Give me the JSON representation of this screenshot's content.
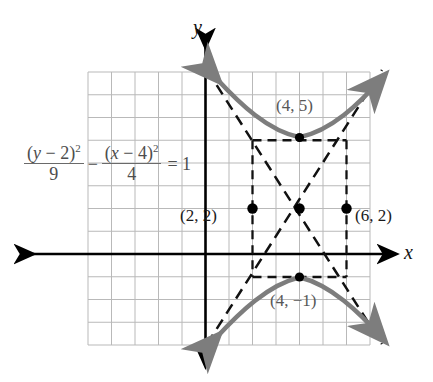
{
  "figure": {
    "colors": {
      "grid": "#b9b9b9",
      "axis": "#000000",
      "curve": "#7d7d7d",
      "asymptote": "#111111",
      "point": "#000000",
      "equation_text": "#4d4d4d"
    }
  },
  "equation": {
    "numerator_1": "(y − 2)",
    "numerator_1_exp": "2",
    "denominator_1": "9",
    "operator": "−",
    "numerator_2": "(x − 4)",
    "numerator_2_exp": "2",
    "denominator_2": "4",
    "equals": "= 1",
    "plain": "(y − 2)²/9 − (x − 4)²/4 = 1"
  },
  "axes": {
    "x_label": "x",
    "y_label": "y"
  },
  "labels": {
    "vertex_top": "(4, 5)",
    "vertex_bottom": "(4, −1)",
    "point_left": "(2, 2)",
    "point_right": "(6, 2)"
  },
  "chart_data": {
    "type": "line",
    "xlabel": "x",
    "ylabel": "y",
    "grid": true,
    "legend": "none",
    "xlim": [
      -2,
      10
    ],
    "ylim": [
      -6,
      6
    ],
    "grid_step": 1,
    "conic": {
      "kind": "hyperbola",
      "orientation": "vertical",
      "center": [
        4,
        2
      ],
      "a": 3,
      "b": 2,
      "vertices": [
        [
          4,
          5
        ],
        [
          4,
          -1
        ]
      ],
      "asymptote_slopes": [
        1.5,
        -1.5
      ],
      "asymptote_equations": [
        "y − 2 = 1.5(x − 4)",
        "y − 2 = -1.5(x − 4)"
      ],
      "fundamental_rectangle": {
        "x": [
          2,
          6
        ],
        "y": [
          -1,
          5
        ]
      }
    },
    "marked_points": [
      {
        "label": "(4, 5)",
        "x": 4,
        "y": 5,
        "kind": "vertex"
      },
      {
        "label": "(4, −1)",
        "x": 4,
        "y": -1,
        "kind": "vertex"
      },
      {
        "label": "(2, 2)",
        "x": 2,
        "y": 2,
        "kind": "rectangle-corner-midpoint"
      },
      {
        "label": "(6, 2)",
        "x": 6,
        "y": 2,
        "kind": "rectangle-corner-midpoint"
      },
      {
        "label": "",
        "x": 4,
        "y": 2,
        "kind": "center"
      }
    ],
    "series": [
      {
        "name": "upper branch",
        "x": [
          1.2,
          1.6,
          2.0,
          2.4,
          2.8,
          3.2,
          3.6,
          4.0,
          4.4,
          4.8,
          5.2,
          5.6,
          6.0,
          6.4,
          6.8
        ],
        "y": [
          7.25,
          6.45,
          5.71,
          5.08,
          4.58,
          4.24,
          4.06,
          4.0,
          4.06,
          4.24,
          4.58,
          5.08,
          5.71,
          6.45,
          7.25
        ]
      },
      {
        "name": "lower branch",
        "x": [
          1.2,
          1.6,
          2.0,
          2.4,
          2.8,
          3.2,
          3.6,
          4.0,
          4.4,
          4.8,
          5.2,
          5.6,
          6.0,
          6.4,
          6.8
        ],
        "y": [
          -3.25,
          -2.45,
          -1.71,
          -1.08,
          -0.58,
          -0.24,
          -0.06,
          0.0,
          -0.06,
          -0.24,
          -0.58,
          -1.08,
          -1.71,
          -2.45,
          -3.25
        ]
      }
    ]
  }
}
